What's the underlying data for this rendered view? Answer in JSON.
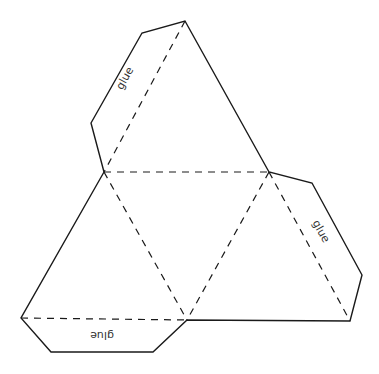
{
  "diagram": {
    "type": "tetrahedron-net",
    "colors": {
      "line": "#1a1a1a",
      "text": "#333333",
      "background": "#ffffff"
    },
    "faces": 4,
    "labels": {
      "top_left_flap": "glue",
      "right_flap": "glue",
      "bottom_flap": "glue"
    }
  }
}
